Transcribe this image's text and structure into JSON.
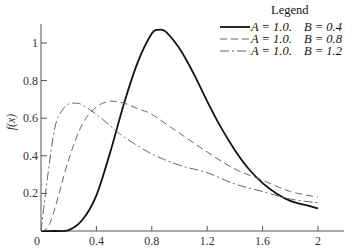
{
  "chart_data": {
    "type": "line",
    "title": "",
    "xlabel": "",
    "ylabel": "f(x)",
    "xlim": [
      0,
      2.2
    ],
    "ylim": [
      0,
      1.12
    ],
    "grid": false,
    "x_ticks": [
      0,
      0.4,
      0.8,
      1.2,
      1.6,
      2
    ],
    "x_tick_labels": [
      "0",
      "0.4",
      "0.8",
      "1.2",
      "1.6",
      "2"
    ],
    "y_ticks": [
      0.2,
      0.4,
      0.6,
      0.8,
      1
    ],
    "y_tick_labels": [
      "0.2",
      "0.4",
      "0.6",
      "0.8",
      "1"
    ],
    "legend": {
      "title": "Legend",
      "placement": "top-right",
      "entries": [
        {
          "a_text": "A = 1.0.",
          "b_text": "B = 0.4"
        },
        {
          "a_text": "A = 1.0.",
          "b_text": "B = 0.8"
        },
        {
          "a_text": "A = 1.0.",
          "b_text": "B = 1.2"
        }
      ]
    },
    "series": [
      {
        "name": "A = 1.0, B = 0.4",
        "style": "solid",
        "color": "#111111",
        "x": [
          0,
          0.1,
          0.2,
          0.3,
          0.4,
          0.5,
          0.6,
          0.7,
          0.8,
          0.85,
          0.9,
          1.0,
          1.1,
          1.2,
          1.3,
          1.4,
          1.5,
          1.6,
          1.7,
          1.8,
          1.9,
          2.0
        ],
        "y": [
          0,
          0,
          0.005,
          0.06,
          0.19,
          0.42,
          0.68,
          0.9,
          1.05,
          1.07,
          1.06,
          0.97,
          0.84,
          0.69,
          0.55,
          0.43,
          0.33,
          0.255,
          0.2,
          0.16,
          0.14,
          0.12
        ]
      },
      {
        "name": "A = 1.0, B = 0.8",
        "style": "dashed",
        "color": "#666666",
        "x": [
          0,
          0.05,
          0.1,
          0.2,
          0.3,
          0.4,
          0.5,
          0.6,
          0.7,
          0.8,
          1.0,
          1.2,
          1.4,
          1.6,
          1.8,
          2.0
        ],
        "y": [
          0,
          0.02,
          0.12,
          0.38,
          0.57,
          0.66,
          0.69,
          0.68,
          0.65,
          0.62,
          0.52,
          0.42,
          0.33,
          0.27,
          0.21,
          0.18
        ]
      },
      {
        "name": "A = 1.0, B = 1.2",
        "style": "dash-dot",
        "color": "#666666",
        "x": [
          0,
          0.05,
          0.1,
          0.15,
          0.2,
          0.25,
          0.3,
          0.4,
          0.5,
          0.6,
          0.8,
          1.0,
          1.2,
          1.4,
          1.6,
          1.8,
          2.0
        ],
        "y": [
          0,
          0.3,
          0.55,
          0.64,
          0.675,
          0.68,
          0.67,
          0.62,
          0.56,
          0.5,
          0.41,
          0.35,
          0.31,
          0.25,
          0.21,
          0.17,
          0.15
        ]
      }
    ]
  }
}
